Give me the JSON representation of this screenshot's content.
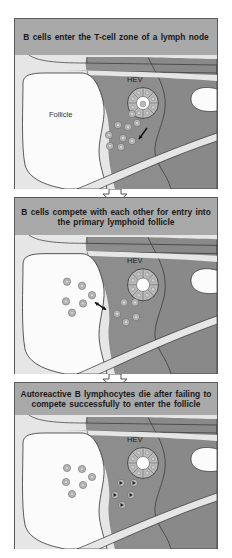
{
  "figure": {
    "colors": {
      "header_bg": "#a9a9a9",
      "t_zone": "#8d8d8d",
      "t_zone_right": "#898989",
      "follicle": "#fbfbfb",
      "light_strip": "#e6e6e6",
      "outline": "#333333",
      "cell_fill": "#b8b8b8",
      "cell_core": "#d8d8d8"
    },
    "panels": [
      {
        "id": "panel-1",
        "title": "B cells enter the T-cell zone of a lymph node",
        "hev_label": "HEV",
        "follicle_label": "Follicle",
        "hev_lumen_has_cell": true,
        "follicle_cells": [],
        "t_zone_cells": [
          [
            117,
            59
          ],
          [
            122,
            68
          ],
          [
            103,
            70
          ],
          [
            113,
            72
          ],
          [
            94,
            80
          ],
          [
            108,
            83
          ],
          [
            117,
            86
          ],
          [
            95,
            91
          ],
          [
            106,
            92
          ]
        ],
        "apoptotic_cells": [],
        "arrow": {
          "type": "single",
          "from": [
            132,
            73
          ],
          "to": [
            124,
            84
          ]
        }
      },
      {
        "id": "panel-2",
        "title": "B cells compete with each other for entry into the primary lymphoid follicle",
        "hev_label": "HEV",
        "follicle_label": "",
        "hev_lumen_has_cell": false,
        "follicle_cells": [
          [
            52,
            45
          ],
          [
            67,
            49
          ],
          [
            77,
            58
          ],
          [
            51,
            64
          ],
          [
            68,
            66
          ],
          [
            57,
            75
          ]
        ],
        "t_zone_cells": [
          [
            109,
            65
          ],
          [
            120,
            65
          ],
          [
            102,
            76
          ],
          [
            121,
            79
          ],
          [
            111,
            84
          ]
        ],
        "apoptotic_cells": [],
        "arrow": {
          "type": "double",
          "from": [
            80,
            65
          ],
          "to": [
            91,
            72
          ]
        }
      },
      {
        "id": "panel-3",
        "title": "Autoreactive B lymphocytes die after failing to compete successfully to enter the follicle",
        "hev_label": "HEV",
        "follicle_label": "",
        "hev_lumen_has_cell": false,
        "follicle_cells": [
          [
            52,
            53
          ],
          [
            67,
            54
          ],
          [
            77,
            62
          ],
          [
            51,
            67
          ],
          [
            68,
            70
          ],
          [
            57,
            79
          ]
        ],
        "t_zone_cells": [],
        "apoptotic_cells": [
          [
            106,
            68
          ],
          [
            119,
            68
          ],
          [
            100,
            80
          ],
          [
            116,
            80
          ],
          [
            107,
            90
          ]
        ],
        "arrow": null
      }
    ],
    "flow_arrows": [
      {
        "from": "panel-1",
        "to": "panel-2"
      },
      {
        "from": "panel-2",
        "to": "panel-3"
      }
    ]
  }
}
